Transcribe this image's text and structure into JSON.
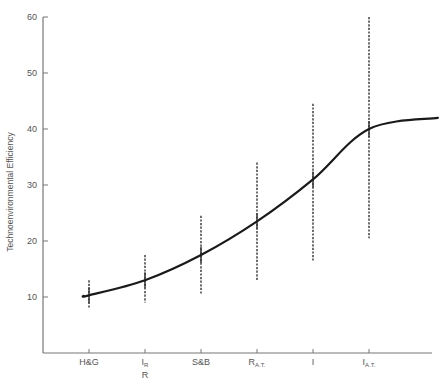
{
  "chart_data": {
    "type": "line",
    "title": "",
    "xlabel": "",
    "ylabel": "Technoenvironmental Efficiency",
    "ylim": [
      0,
      60
    ],
    "yticks": [
      10,
      20,
      30,
      40,
      50,
      60
    ],
    "grid": false,
    "legend": null,
    "categories": [
      {
        "main": "H&G",
        "sub": "",
        "below": ""
      },
      {
        "main": "I",
        "sub": "R",
        "below": "R"
      },
      {
        "main": "S&B",
        "sub": "",
        "below": ""
      },
      {
        "main": "R",
        "sub": "A.T.",
        "below": ""
      },
      {
        "main": "I",
        "sub": "",
        "below": ""
      },
      {
        "main": "I",
        "sub": "A.T.",
        "below": ""
      }
    ],
    "category_labels": [
      "H&G",
      "I_R / R",
      "S&B",
      "R_A.T.",
      "I",
      "I_A.T."
    ],
    "series": [
      {
        "name": "fitted curve",
        "style": "solid",
        "values": [
          10.3,
          13.0,
          17.5,
          23.5,
          31.0,
          40.0
        ],
        "start": {
          "x_index": -0.1,
          "y": 10.2
        },
        "end": {
          "x_index": 6.23,
          "y": 42.0
        }
      },
      {
        "name": "range",
        "style": "dashed-errorbar",
        "low": [
          8.0,
          9.0,
          10.5,
          13.0,
          16.5,
          20.5
        ],
        "high": [
          13.0,
          17.5,
          24.5,
          34.0,
          44.5,
          60.0
        ]
      }
    ]
  }
}
